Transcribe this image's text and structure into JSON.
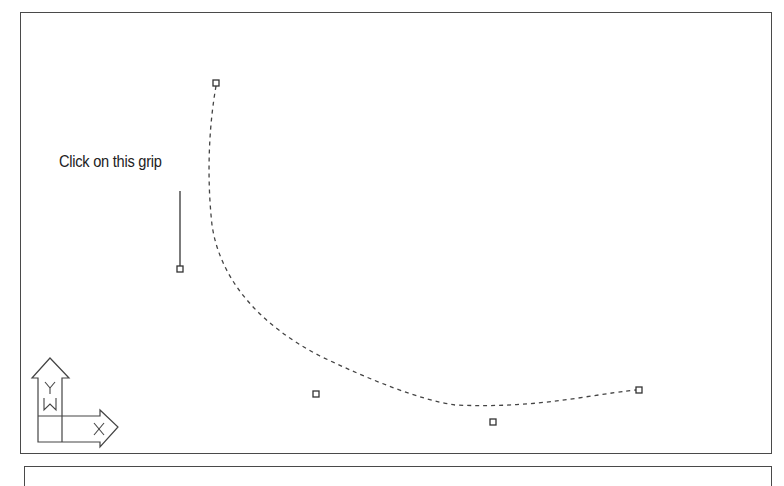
{
  "drawing": {
    "callout": {
      "label": "Click on this grip"
    },
    "spline": {
      "style": "dashed",
      "color": "#444444",
      "start_grip": {
        "x": 216,
        "y": 83
      },
      "end_grip": {
        "x": 639,
        "y": 390
      }
    },
    "grips": [
      {
        "name": "spline-start-grip",
        "x": 216,
        "y": 83
      },
      {
        "name": "control-point-grip-1",
        "x": 180,
        "y": 269
      },
      {
        "name": "control-point-grip-2",
        "x": 316,
        "y": 394
      },
      {
        "name": "control-point-grip-3",
        "x": 493,
        "y": 422
      },
      {
        "name": "spline-end-grip",
        "x": 639,
        "y": 390
      }
    ],
    "ucs_icon": {
      "x_label": "X",
      "y_label": "Y",
      "w_label": "W"
    }
  },
  "colors": {
    "line": "#444444",
    "frame": "#4a4a4a",
    "background": "#ffffff"
  }
}
